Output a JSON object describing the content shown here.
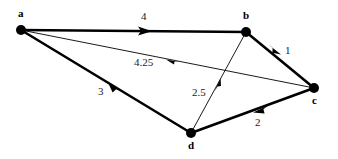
{
  "figure": {
    "type": "directed-weighted-graph",
    "background_color": "#ffffff",
    "stroke_color": "#000000",
    "width": 338,
    "height": 159
  },
  "nodes": [
    {
      "id": "a",
      "label": "a",
      "x": 21,
      "y": 30,
      "r": 5,
      "label_x": 18,
      "label_y": 8
    },
    {
      "id": "b",
      "label": "b",
      "x": 246,
      "y": 32,
      "r": 5,
      "label_x": 243,
      "label_y": 10
    },
    {
      "id": "c",
      "label": "c",
      "x": 314,
      "y": 88,
      "r": 5,
      "label_x": 312,
      "label_y": 95
    },
    {
      "id": "d",
      "label": "d",
      "x": 191,
      "y": 133,
      "r": 5,
      "label_x": 188,
      "label_y": 140
    }
  ],
  "edges": [
    {
      "id": "a-b",
      "from": "a",
      "to": "b",
      "weight": "4",
      "style": "thick",
      "label_x": 141,
      "label_y": 11
    },
    {
      "id": "b-c",
      "from": "b",
      "to": "c",
      "weight": "1",
      "style": "thick",
      "label_x": 285,
      "label_y": 45
    },
    {
      "id": "c-d",
      "from": "c",
      "to": "d",
      "weight": "2",
      "style": "thick",
      "label_x": 255,
      "label_y": 117
    },
    {
      "id": "d-a",
      "from": "d",
      "to": "a",
      "weight": "3",
      "style": "thick",
      "label_x": 98,
      "label_y": 86
    },
    {
      "id": "c-a",
      "from": "c",
      "to": "a",
      "weight": "4.25",
      "style": "thin",
      "label_x": 134,
      "label_y": 57
    },
    {
      "id": "d-b",
      "from": "d",
      "to": "b",
      "weight": "2.5",
      "style": "thin",
      "label_x": 192,
      "label_y": 87
    }
  ]
}
